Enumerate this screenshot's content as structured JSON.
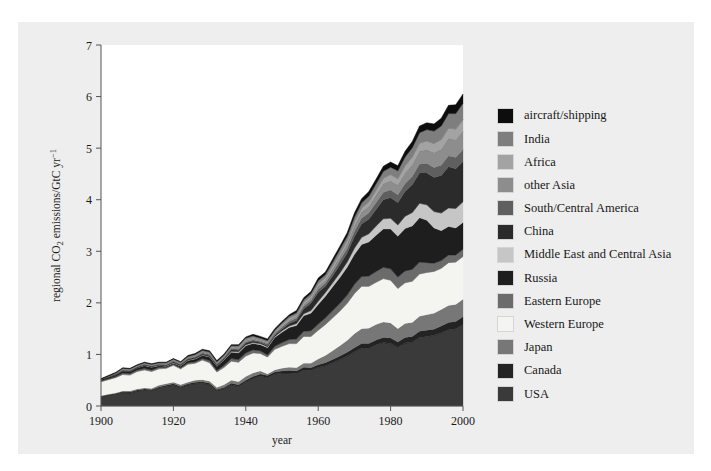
{
  "figure": {
    "background_color": "#eeeeee",
    "plot_background_color": "#ffffff"
  },
  "chart_data": {
    "type": "area",
    "stacked": true,
    "title": "",
    "xlabel": "year",
    "ylabel": "regional CO2 emissions/GtC yr-1",
    "ylabel_display": "regional CO₂ emissions/GtC yr⁻¹",
    "xlim": [
      1900,
      2000
    ],
    "ylim": [
      0,
      7
    ],
    "xticks": [
      1900,
      1920,
      1940,
      1960,
      1980,
      2000
    ],
    "xtick_labels": [
      "1900",
      "1920",
      "1940",
      "1960",
      "1980",
      "2000"
    ],
    "yticks": [
      0,
      1,
      2,
      3,
      4,
      5,
      6,
      7
    ],
    "ytick_labels": [
      "0",
      "1",
      "2",
      "3",
      "4",
      "5",
      "6",
      "7"
    ],
    "grid": false,
    "legend_position": "right",
    "x": [
      1900,
      1902,
      1904,
      1906,
      1908,
      1910,
      1912,
      1914,
      1916,
      1918,
      1920,
      1922,
      1924,
      1926,
      1928,
      1930,
      1932,
      1934,
      1936,
      1938,
      1940,
      1942,
      1944,
      1946,
      1948,
      1950,
      1952,
      1954,
      1956,
      1958,
      1960,
      1962,
      1964,
      1966,
      1968,
      1970,
      1972,
      1974,
      1976,
      1978,
      1980,
      1982,
      1984,
      1986,
      1988,
      1990,
      1992,
      1994,
      1996,
      1998,
      2000
    ],
    "series": [
      {
        "name": "USA",
        "color": "#3a3a3a",
        "values": [
          0.18,
          0.21,
          0.23,
          0.26,
          0.25,
          0.29,
          0.31,
          0.3,
          0.35,
          0.38,
          0.4,
          0.36,
          0.41,
          0.43,
          0.44,
          0.41,
          0.3,
          0.34,
          0.41,
          0.38,
          0.47,
          0.53,
          0.58,
          0.55,
          0.62,
          0.64,
          0.64,
          0.63,
          0.7,
          0.69,
          0.75,
          0.78,
          0.84,
          0.9,
          0.97,
          1.05,
          1.12,
          1.12,
          1.19,
          1.23,
          1.21,
          1.14,
          1.22,
          1.24,
          1.33,
          1.35,
          1.37,
          1.42,
          1.48,
          1.5,
          1.58
        ]
      },
      {
        "name": "Canada",
        "color": "#232323",
        "values": [
          0.01,
          0.01,
          0.01,
          0.02,
          0.02,
          0.02,
          0.02,
          0.02,
          0.02,
          0.02,
          0.03,
          0.02,
          0.02,
          0.03,
          0.03,
          0.03,
          0.02,
          0.02,
          0.03,
          0.03,
          0.03,
          0.04,
          0.04,
          0.04,
          0.04,
          0.04,
          0.05,
          0.05,
          0.05,
          0.05,
          0.05,
          0.06,
          0.06,
          0.07,
          0.07,
          0.08,
          0.09,
          0.09,
          0.09,
          0.1,
          0.11,
          0.1,
          0.11,
          0.11,
          0.12,
          0.12,
          0.12,
          0.13,
          0.14,
          0.14,
          0.15
        ]
      },
      {
        "name": "Japan",
        "color": "#777777",
        "values": [
          0.01,
          0.01,
          0.01,
          0.01,
          0.02,
          0.02,
          0.02,
          0.02,
          0.03,
          0.03,
          0.03,
          0.03,
          0.03,
          0.04,
          0.04,
          0.04,
          0.04,
          0.05,
          0.06,
          0.06,
          0.07,
          0.07,
          0.06,
          0.03,
          0.04,
          0.05,
          0.06,
          0.06,
          0.08,
          0.09,
          0.11,
          0.14,
          0.17,
          0.2,
          0.23,
          0.27,
          0.29,
          0.3,
          0.3,
          0.3,
          0.29,
          0.26,
          0.27,
          0.27,
          0.29,
          0.3,
          0.31,
          0.32,
          0.33,
          0.33,
          0.34
        ]
      },
      {
        "name": "Western Europe",
        "color": "#f4f4f0",
        "values": [
          0.27,
          0.28,
          0.3,
          0.32,
          0.31,
          0.34,
          0.35,
          0.33,
          0.32,
          0.3,
          0.33,
          0.31,
          0.35,
          0.33,
          0.38,
          0.36,
          0.3,
          0.34,
          0.37,
          0.38,
          0.4,
          0.39,
          0.34,
          0.33,
          0.4,
          0.43,
          0.46,
          0.47,
          0.52,
          0.52,
          0.56,
          0.6,
          0.64,
          0.67,
          0.72,
          0.78,
          0.82,
          0.81,
          0.82,
          0.84,
          0.83,
          0.78,
          0.79,
          0.8,
          0.82,
          0.82,
          0.81,
          0.8,
          0.83,
          0.82,
          0.83
        ]
      },
      {
        "name": "Eastern Europe",
        "color": "#6b6b6b",
        "values": [
          0.02,
          0.02,
          0.02,
          0.03,
          0.03,
          0.03,
          0.03,
          0.03,
          0.03,
          0.02,
          0.02,
          0.02,
          0.03,
          0.03,
          0.03,
          0.04,
          0.03,
          0.04,
          0.05,
          0.05,
          0.06,
          0.06,
          0.05,
          0.04,
          0.06,
          0.07,
          0.08,
          0.09,
          0.1,
          0.11,
          0.12,
          0.13,
          0.14,
          0.15,
          0.16,
          0.18,
          0.19,
          0.2,
          0.21,
          0.22,
          0.22,
          0.22,
          0.23,
          0.23,
          0.23,
          0.19,
          0.16,
          0.15,
          0.15,
          0.14,
          0.14
        ]
      },
      {
        "name": "Russia",
        "color": "#1e1e1e",
        "values": [
          0.03,
          0.03,
          0.03,
          0.04,
          0.04,
          0.04,
          0.05,
          0.05,
          0.03,
          0.02,
          0.02,
          0.03,
          0.04,
          0.05,
          0.06,
          0.07,
          0.08,
          0.1,
          0.12,
          0.13,
          0.14,
          0.12,
          0.12,
          0.14,
          0.17,
          0.2,
          0.23,
          0.26,
          0.3,
          0.34,
          0.38,
          0.42,
          0.46,
          0.5,
          0.54,
          0.58,
          0.62,
          0.66,
          0.7,
          0.74,
          0.77,
          0.79,
          0.82,
          0.84,
          0.86,
          0.82,
          0.68,
          0.58,
          0.55,
          0.52,
          0.52
        ]
      },
      {
        "name": "Middle East and Central Asia",
        "color": "#c6c6c6",
        "values": [
          0.0,
          0.0,
          0.0,
          0.0,
          0.0,
          0.0,
          0.01,
          0.01,
          0.01,
          0.01,
          0.01,
          0.01,
          0.01,
          0.01,
          0.01,
          0.01,
          0.01,
          0.01,
          0.02,
          0.02,
          0.02,
          0.02,
          0.02,
          0.02,
          0.02,
          0.03,
          0.03,
          0.04,
          0.04,
          0.05,
          0.06,
          0.07,
          0.08,
          0.09,
          0.1,
          0.12,
          0.14,
          0.16,
          0.18,
          0.2,
          0.21,
          0.22,
          0.24,
          0.26,
          0.28,
          0.3,
          0.32,
          0.34,
          0.36,
          0.38,
          0.4
        ]
      },
      {
        "name": "China",
        "color": "#2b2b2b",
        "values": [
          0.0,
          0.01,
          0.01,
          0.01,
          0.01,
          0.01,
          0.01,
          0.01,
          0.01,
          0.01,
          0.02,
          0.02,
          0.02,
          0.02,
          0.02,
          0.02,
          0.02,
          0.02,
          0.03,
          0.03,
          0.03,
          0.03,
          0.02,
          0.02,
          0.02,
          0.03,
          0.05,
          0.06,
          0.09,
          0.14,
          0.17,
          0.12,
          0.13,
          0.16,
          0.17,
          0.22,
          0.26,
          0.28,
          0.32,
          0.37,
          0.4,
          0.43,
          0.48,
          0.54,
          0.59,
          0.62,
          0.66,
          0.73,
          0.8,
          0.77,
          0.78
        ]
      },
      {
        "name": "South/Central America",
        "color": "#5f5f5f",
        "values": [
          0.0,
          0.0,
          0.01,
          0.01,
          0.01,
          0.01,
          0.01,
          0.01,
          0.01,
          0.01,
          0.01,
          0.01,
          0.01,
          0.01,
          0.02,
          0.02,
          0.01,
          0.02,
          0.02,
          0.02,
          0.02,
          0.02,
          0.02,
          0.03,
          0.03,
          0.03,
          0.04,
          0.04,
          0.05,
          0.05,
          0.06,
          0.06,
          0.07,
          0.08,
          0.09,
          0.1,
          0.11,
          0.12,
          0.13,
          0.14,
          0.15,
          0.15,
          0.15,
          0.16,
          0.17,
          0.18,
          0.19,
          0.2,
          0.21,
          0.22,
          0.23
        ]
      },
      {
        "name": "other Asia",
        "color": "#8d8d8d",
        "values": [
          0.0,
          0.0,
          0.01,
          0.01,
          0.01,
          0.01,
          0.01,
          0.01,
          0.01,
          0.01,
          0.01,
          0.01,
          0.01,
          0.02,
          0.02,
          0.02,
          0.02,
          0.02,
          0.02,
          0.02,
          0.03,
          0.03,
          0.02,
          0.02,
          0.02,
          0.03,
          0.03,
          0.04,
          0.04,
          0.05,
          0.06,
          0.06,
          0.07,
          0.08,
          0.09,
          0.11,
          0.12,
          0.13,
          0.15,
          0.17,
          0.18,
          0.19,
          0.21,
          0.23,
          0.25,
          0.27,
          0.29,
          0.31,
          0.34,
          0.34,
          0.36
        ]
      },
      {
        "name": "Africa",
        "color": "#a3a3a3",
        "values": [
          0.0,
          0.0,
          0.0,
          0.01,
          0.01,
          0.01,
          0.01,
          0.01,
          0.01,
          0.01,
          0.01,
          0.01,
          0.01,
          0.01,
          0.01,
          0.01,
          0.01,
          0.01,
          0.02,
          0.02,
          0.02,
          0.02,
          0.02,
          0.02,
          0.02,
          0.03,
          0.03,
          0.03,
          0.04,
          0.04,
          0.05,
          0.05,
          0.06,
          0.06,
          0.07,
          0.08,
          0.08,
          0.09,
          0.1,
          0.11,
          0.12,
          0.13,
          0.14,
          0.15,
          0.16,
          0.17,
          0.18,
          0.19,
          0.2,
          0.21,
          0.22
        ]
      },
      {
        "name": "India",
        "color": "#7e7e7e",
        "values": [
          0.0,
          0.01,
          0.01,
          0.01,
          0.01,
          0.01,
          0.01,
          0.01,
          0.01,
          0.02,
          0.02,
          0.02,
          0.02,
          0.02,
          0.02,
          0.02,
          0.02,
          0.02,
          0.02,
          0.03,
          0.03,
          0.03,
          0.03,
          0.03,
          0.03,
          0.03,
          0.04,
          0.04,
          0.05,
          0.05,
          0.06,
          0.06,
          0.07,
          0.08,
          0.08,
          0.09,
          0.1,
          0.11,
          0.12,
          0.13,
          0.14,
          0.15,
          0.17,
          0.18,
          0.2,
          0.22,
          0.24,
          0.26,
          0.28,
          0.3,
          0.32
        ]
      },
      {
        "name": "aircraft/shipping",
        "color": "#0d0d0d",
        "values": [
          0.01,
          0.01,
          0.01,
          0.01,
          0.01,
          0.01,
          0.01,
          0.01,
          0.01,
          0.01,
          0.01,
          0.01,
          0.02,
          0.02,
          0.02,
          0.02,
          0.02,
          0.02,
          0.02,
          0.02,
          0.02,
          0.03,
          0.03,
          0.03,
          0.03,
          0.03,
          0.03,
          0.04,
          0.04,
          0.04,
          0.05,
          0.05,
          0.06,
          0.06,
          0.07,
          0.08,
          0.08,
          0.09,
          0.09,
          0.1,
          0.1,
          0.1,
          0.11,
          0.12,
          0.13,
          0.13,
          0.14,
          0.15,
          0.16,
          0.17,
          0.18
        ]
      }
    ]
  },
  "legend": {
    "items": [
      {
        "label": "aircraft/shipping",
        "color": "#0d0d0d"
      },
      {
        "label": "India",
        "color": "#7e7e7e"
      },
      {
        "label": "Africa",
        "color": "#a3a3a3"
      },
      {
        "label": "other Asia",
        "color": "#8d8d8d"
      },
      {
        "label": "South/Central America",
        "color": "#5f5f5f"
      },
      {
        "label": "China",
        "color": "#2b2b2b"
      },
      {
        "label": "Middle East and Central Asia",
        "color": "#c6c6c6"
      },
      {
        "label": "Russia",
        "color": "#1e1e1e"
      },
      {
        "label": "Eastern Europe",
        "color": "#6b6b6b"
      },
      {
        "label": "Western Europe",
        "color": "#f4f4f0"
      },
      {
        "label": "Japan",
        "color": "#777777"
      },
      {
        "label": "Canada",
        "color": "#232323"
      },
      {
        "label": "USA",
        "color": "#3a3a3a"
      }
    ]
  }
}
